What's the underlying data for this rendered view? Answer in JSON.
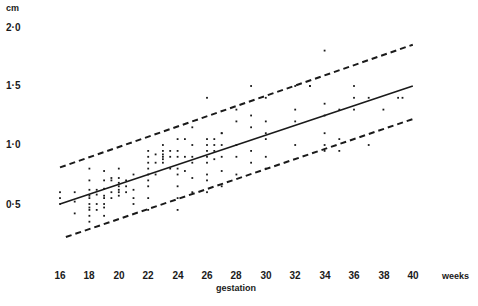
{
  "chart_data": {
    "type": "scatter",
    "title": "",
    "xlabel": "gestation",
    "x_unit_label": "weeks",
    "ylabel": "cm",
    "xlim": [
      16,
      40
    ],
    "ylim": [
      0.0,
      2.0
    ],
    "grid": false,
    "legend": "none",
    "x_ticks": [
      "16",
      "18",
      "20",
      "22",
      "24",
      "26",
      "28",
      "30",
      "32",
      "34",
      "36",
      "38",
      "40"
    ],
    "x_tick_values": [
      16,
      18,
      20,
      22,
      24,
      26,
      28,
      30,
      32,
      34,
      36,
      38,
      40
    ],
    "y_ticks": [
      "2·0",
      "1·5",
      "1·0",
      "0·5"
    ],
    "y_tick_values": [
      2.0,
      1.5,
      1.0,
      0.5
    ],
    "regression_line": {
      "name": "mean",
      "style": "solid",
      "points": [
        [
          16,
          0.5
        ],
        [
          40,
          1.5
        ]
      ]
    },
    "upper_limit": {
      "name": "upper limit",
      "style": "dashed",
      "points": [
        [
          16,
          0.81
        ],
        [
          40,
          1.85
        ]
      ]
    },
    "lower_limit": {
      "name": "lower limit",
      "style": "dashed",
      "points": [
        [
          16.4,
          0.22
        ],
        [
          40,
          1.22
        ]
      ]
    },
    "series": [
      {
        "name": "observations",
        "points": [
          [
            16,
            0.6
          ],
          [
            16,
            0.55
          ],
          [
            16,
            0.5
          ],
          [
            17,
            0.6
          ],
          [
            17,
            0.52
          ],
          [
            17,
            0.42
          ],
          [
            18,
            0.62
          ],
          [
            18,
            0.57
          ],
          [
            18,
            0.55
          ],
          [
            18,
            0.5
          ],
          [
            18,
            0.47
          ],
          [
            18,
            0.45
          ],
          [
            18,
            0.4
          ],
          [
            18,
            0.35
          ],
          [
            18,
            0.8
          ],
          [
            18,
            0.7
          ],
          [
            18.5,
            0.62
          ],
          [
            18.5,
            0.58
          ],
          [
            18.5,
            0.5
          ],
          [
            18.5,
            0.45
          ],
          [
            19,
            0.78
          ],
          [
            19,
            0.7
          ],
          [
            19,
            0.63
          ],
          [
            19,
            0.57
          ],
          [
            19,
            0.55
          ],
          [
            19,
            0.5
          ],
          [
            19,
            0.47
          ],
          [
            19,
            0.4
          ],
          [
            19.5,
            0.72
          ],
          [
            19.5,
            0.7
          ],
          [
            19.5,
            0.6
          ],
          [
            19.5,
            0.55
          ],
          [
            20,
            0.72
          ],
          [
            20,
            0.68
          ],
          [
            20,
            0.65
          ],
          [
            20,
            0.62
          ],
          [
            20,
            0.6
          ],
          [
            20,
            0.57
          ],
          [
            20,
            0.8
          ],
          [
            20.5,
            0.7
          ],
          [
            20.5,
            0.65
          ],
          [
            20.5,
            0.6
          ],
          [
            21,
            0.75
          ],
          [
            21,
            0.62
          ],
          [
            21,
            0.55
          ],
          [
            21,
            0.5
          ],
          [
            22,
            0.95
          ],
          [
            22,
            0.9
          ],
          [
            22,
            0.85
          ],
          [
            22,
            0.8
          ],
          [
            22,
            0.75
          ],
          [
            22,
            0.7
          ],
          [
            22,
            0.65
          ],
          [
            22,
            0.55
          ],
          [
            22,
            0.45
          ],
          [
            22.5,
            0.92
          ],
          [
            22.5,
            0.85
          ],
          [
            22.5,
            0.75
          ],
          [
            23,
            0.95
          ],
          [
            23,
            0.92
          ],
          [
            23,
            0.9
          ],
          [
            23,
            0.88
          ],
          [
            23,
            0.85
          ],
          [
            23,
            1.0
          ],
          [
            23.5,
            0.95
          ],
          [
            23.5,
            0.9
          ],
          [
            23.5,
            0.8
          ],
          [
            24,
            1.05
          ],
          [
            24,
            0.95
          ],
          [
            24,
            0.9
          ],
          [
            24,
            0.8
          ],
          [
            24,
            0.75
          ],
          [
            24,
            0.65
          ],
          [
            24,
            0.55
          ],
          [
            24,
            0.45
          ],
          [
            24.5,
            1.05
          ],
          [
            24.5,
            0.9
          ],
          [
            24.5,
            0.78
          ],
          [
            25,
            1.15
          ],
          [
            25,
            1.0
          ],
          [
            25,
            0.9
          ],
          [
            25,
            0.85
          ],
          [
            25,
            0.72
          ],
          [
            25,
            0.6
          ],
          [
            26,
            1.4
          ],
          [
            26,
            1.05
          ],
          [
            26,
            1.0
          ],
          [
            26,
            0.95
          ],
          [
            26,
            0.9
          ],
          [
            26,
            0.85
          ],
          [
            26,
            0.75
          ],
          [
            26,
            0.7
          ],
          [
            26,
            0.6
          ],
          [
            26.5,
            1.05
          ],
          [
            26.5,
            1.0
          ],
          [
            26.5,
            0.95
          ],
          [
            26.5,
            0.88
          ],
          [
            27,
            1.1
          ],
          [
            27,
            1.1
          ],
          [
            27,
            1.0
          ],
          [
            27,
            0.9
          ],
          [
            27,
            0.78
          ],
          [
            27,
            0.65
          ],
          [
            28,
            1.3
          ],
          [
            28,
            1.2
          ],
          [
            28,
            1.0
          ],
          [
            28,
            0.9
          ],
          [
            28,
            0.75
          ],
          [
            29,
            1.5
          ],
          [
            29,
            1.25
          ],
          [
            29,
            1.15
          ],
          [
            29,
            0.95
          ],
          [
            29,
            0.85
          ],
          [
            30,
            1.4
          ],
          [
            30,
            1.2
          ],
          [
            30,
            1.1
          ],
          [
            30,
            1.05
          ],
          [
            30,
            0.9
          ],
          [
            30,
            0.8
          ],
          [
            32,
            1.5
          ],
          [
            32,
            1.3
          ],
          [
            32,
            1.2
          ],
          [
            32,
            1.0
          ],
          [
            33,
            1.5
          ],
          [
            33,
            1.5
          ],
          [
            34,
            1.8
          ],
          [
            34,
            1.35
          ],
          [
            34,
            1.25
          ],
          [
            34,
            1.1
          ],
          [
            34,
            1.0
          ],
          [
            34,
            0.95
          ],
          [
            35,
            1.3
          ],
          [
            35,
            1.05
          ],
          [
            35,
            0.95
          ],
          [
            36,
            1.5
          ],
          [
            36,
            1.4
          ],
          [
            36,
            1.3
          ],
          [
            37,
            1.4
          ],
          [
            37,
            1.0
          ],
          [
            38,
            1.3
          ],
          [
            39,
            1.4
          ],
          [
            39.3,
            1.4
          ]
        ]
      }
    ]
  },
  "axis": {
    "y_unit": "cm",
    "y_ticks": [
      "2·0",
      "1·5",
      "1·0",
      "0·5"
    ],
    "x_ticks": [
      "16",
      "18",
      "20",
      "22",
      "24",
      "26",
      "28",
      "30",
      "32",
      "34",
      "36",
      "38",
      "40"
    ],
    "x_unit": "weeks",
    "x_title": "gestation"
  }
}
